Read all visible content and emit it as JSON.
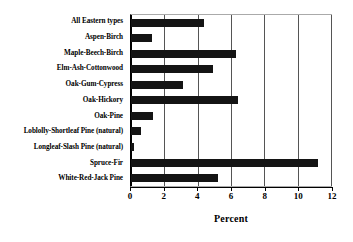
{
  "chart_data": {
    "type": "bar",
    "orientation": "horizontal",
    "title": "",
    "xlabel": "Percent",
    "ylabel": "",
    "xlim": [
      0,
      12
    ],
    "xticks": [
      0,
      2,
      4,
      6,
      8,
      10,
      12
    ],
    "xtick_labels": [
      "0",
      "2",
      "4",
      "6",
      "8",
      "10",
      "12"
    ],
    "grid": true,
    "grid_axis": "x",
    "legend": false,
    "bar_color": "#141414",
    "categories": [
      "All Eastern types",
      "Aspen-Birch",
      "Maple-Beech-Birch",
      "Elm-Ash-Cottonwood",
      "Oak-Gum-Cypress",
      "Oak-Hickory",
      "Oak-Pine",
      "Loblolly-Shortleaf Pine (natural)",
      "Longleaf-Slash Pine (natural)",
      "Spruce-Fir",
      "White-Red-Jack Pine"
    ],
    "values": [
      4.4,
      1.25,
      6.3,
      4.9,
      3.1,
      6.4,
      1.3,
      0.6,
      0.2,
      11.2,
      5.2
    ]
  }
}
